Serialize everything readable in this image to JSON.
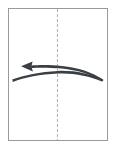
{
  "figure": {
    "background_color": "#ffffff"
  },
  "panel": {
    "name": "paper-sheet",
    "x": 8,
    "y": 8,
    "width": 100,
    "height": 133,
    "fill_color": "#ffffff",
    "border_color": "#9a9a9a",
    "border_width": 1
  },
  "fold_axis": {
    "name": "center-fold-line",
    "orientation": "vertical",
    "x": 57.5,
    "y_start": 9,
    "y_end": 140,
    "style": "dashed",
    "dash_length": 3,
    "gap_length": 2,
    "color": "#b5b5b5"
  },
  "motion_arrow": {
    "name": "fold-motion-arrow",
    "direction": "right-to-left",
    "color": "#3a3f45",
    "arrow_tip": {
      "x": 21,
      "y": 66
    },
    "arrow_tail": {
      "x": 103,
      "y": 79
    },
    "upper_sweep": "from (103,79) arcs up-left through apex near (62,67) to tip (24,66)",
    "lower_sweep": "from (103,79) arcs through (58,76) down-left to (12,79)",
    "head_length": 11,
    "head_half_width": 5
  },
  "labels": {
    "visible_text": []
  }
}
